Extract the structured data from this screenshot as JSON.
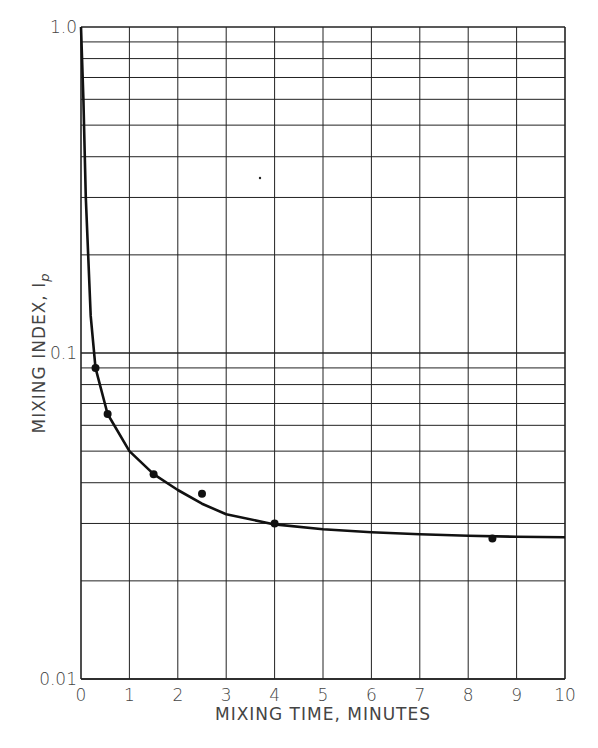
{
  "chart_data": {
    "type": "line",
    "title": "",
    "xlabel": "MIXING TIME, MINUTES",
    "ylabel": "MIXING INDEX, Ip",
    "xlim": [
      0,
      10
    ],
    "ylim": [
      0.01,
      1.0
    ],
    "yscale": "log",
    "grid": true,
    "x_ticks": [
      "0",
      "1",
      "2",
      "3",
      "4",
      "5",
      "6",
      "7",
      "8",
      "9",
      "10"
    ],
    "y_ticks": [
      "0.01",
      "0.1",
      "1.0"
    ],
    "series": [
      {
        "name": "measured points",
        "kind": "scatter",
        "x": [
          0.3,
          0.55,
          1.5,
          2.5,
          4.0,
          8.5
        ],
        "y": [
          0.09,
          0.065,
          0.0425,
          0.037,
          0.03,
          0.027
        ]
      },
      {
        "name": "fitted curve",
        "kind": "line",
        "x": [
          0.0,
          0.05,
          0.1,
          0.2,
          0.3,
          0.55,
          1.0,
          1.5,
          2.0,
          2.5,
          3.0,
          4.0,
          5.0,
          6.0,
          7.0,
          8.0,
          9.0,
          10.0
        ],
        "y": [
          1.0,
          0.6,
          0.3,
          0.13,
          0.09,
          0.065,
          0.05,
          0.0425,
          0.038,
          0.0345,
          0.032,
          0.0298,
          0.0288,
          0.0282,
          0.0278,
          0.0275,
          0.0273,
          0.0272
        ]
      }
    ]
  },
  "labels": {
    "ylabel_main": "MIXING INDEX, I",
    "ylabel_sub": "p"
  }
}
